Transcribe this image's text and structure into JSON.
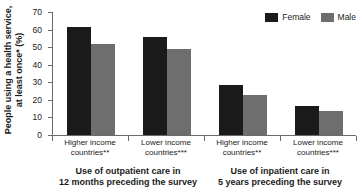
{
  "chart_data": {
    "type": "bar",
    "title": "",
    "xlabel": "",
    "ylabel_line1": "People using a health service,",
    "ylabel_line2": "at least once* (%)",
    "ylim": [
      0,
      70
    ],
    "yticks": [
      0,
      10,
      20,
      30,
      40,
      50,
      60,
      70
    ],
    "ytick_labels": [
      "0",
      "10",
      "20",
      "30",
      "40",
      "50",
      "60",
      "70"
    ],
    "grid": false,
    "legend_position": "top-right",
    "categories": [
      "Higher income countries**",
      "Lower income countries***",
      "Higher income countries**",
      "Lower income countries***"
    ],
    "category_lines": [
      {
        "line1": "Higher income",
        "line2": "countries**"
      },
      {
        "line1": "Lower income",
        "line2": "countries***"
      },
      {
        "line1": "Higher income",
        "line2": "countries**"
      },
      {
        "line1": "Lower income",
        "line2": "countries***"
      }
    ],
    "groups": [
      {
        "line1": "Use of outpatient care in",
        "line2": "12 months preceding the survey"
      },
      {
        "line1": "Use of inpatient care in",
        "line2": "5 years preceding the survey"
      }
    ],
    "series": [
      {
        "name": "Female",
        "color": "#1a1a1a",
        "values": [
          61.5,
          55.5,
          28.5,
          16.5
        ]
      },
      {
        "name": "Male",
        "color": "#6e6e6e",
        "values": [
          52.0,
          49.0,
          22.5,
          13.5
        ]
      }
    ]
  },
  "legend": {
    "female_label": "Female",
    "male_label": "Male"
  },
  "colors": {
    "female": "#1a1a1a",
    "male": "#6e6e6e",
    "axis": "#6a6a6a",
    "text": "#1a1a1a",
    "background": "#ffffff"
  },
  "top_clipped_title": ""
}
